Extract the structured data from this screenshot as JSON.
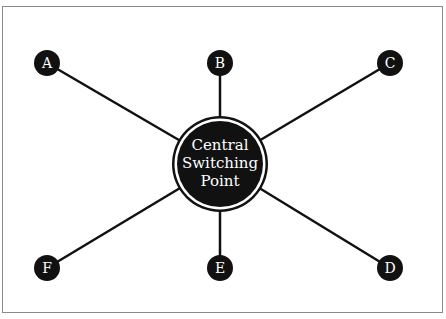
{
  "diagram": {
    "type": "star-network",
    "center": {
      "lines": [
        "Central",
        "Switching",
        "Point"
      ],
      "x": 220,
      "y": 164,
      "r_outer": 48,
      "r_ring": 45,
      "r_inner": 43
    },
    "nodes": [
      {
        "id": "A",
        "label": "A",
        "x": 47,
        "y": 63
      },
      {
        "id": "B",
        "label": "B",
        "x": 220,
        "y": 63
      },
      {
        "id": "C",
        "label": "C",
        "x": 390,
        "y": 63
      },
      {
        "id": "D",
        "label": "D",
        "x": 390,
        "y": 268
      },
      {
        "id": "E",
        "label": "E",
        "x": 220,
        "y": 268
      },
      {
        "id": "F",
        "label": "F",
        "x": 47,
        "y": 268
      }
    ],
    "edges": [
      [
        "center",
        "A"
      ],
      [
        "center",
        "B"
      ],
      [
        "center",
        "C"
      ],
      [
        "center",
        "D"
      ],
      [
        "center",
        "E"
      ],
      [
        "center",
        "F"
      ]
    ],
    "colors": {
      "fill": "#111111",
      "text": "#ffffff",
      "line": "#111111",
      "frame": "#8a8a8a"
    }
  }
}
